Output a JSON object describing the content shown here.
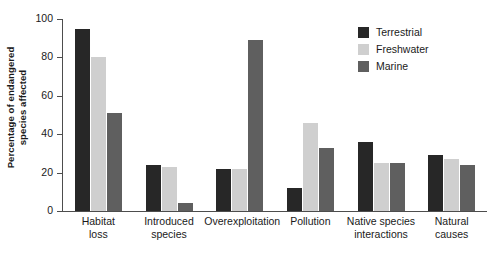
{
  "chart_data": {
    "type": "bar",
    "title": "",
    "xlabel": "",
    "ylabel_line1": "Percentage of endangered",
    "ylabel_line2": "species affected",
    "ylim": [
      0,
      100
    ],
    "yticks": [
      0,
      20,
      40,
      60,
      80,
      100
    ],
    "grid": false,
    "legend_position": "top-right",
    "categories": [
      {
        "line1": "Habitat",
        "line2": "loss"
      },
      {
        "line1": "Introduced",
        "line2": "species"
      },
      {
        "line1": "Overexploitation",
        "line2": ""
      },
      {
        "line1": "Pollution",
        "line2": ""
      },
      {
        "line1": "Native species",
        "line2": "interactions"
      },
      {
        "line1": "Natural",
        "line2": "causes"
      }
    ],
    "series": [
      {
        "name": "Terrestrial",
        "color": "#272727",
        "values": [
          95,
          24,
          22,
          12,
          36,
          29
        ]
      },
      {
        "name": "Freshwater",
        "color": "#cfcfcf",
        "values": [
          80,
          23,
          22,
          46,
          25,
          27
        ]
      },
      {
        "name": "Marine",
        "color": "#5f5f5f",
        "values": [
          51,
          4,
          89,
          33,
          25,
          24
        ]
      }
    ]
  }
}
